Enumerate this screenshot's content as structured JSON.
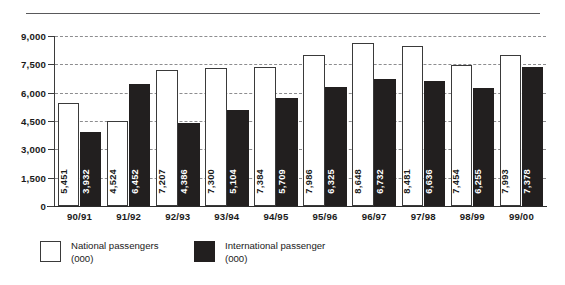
{
  "chart_data": {
    "type": "bar",
    "title": "",
    "subtitle": "",
    "xlabel": "",
    "ylabel": "",
    "ylim": [
      0,
      9000
    ],
    "yticks": [
      "0",
      "1,500",
      "3,000",
      "4,500",
      "6,000",
      "7,500",
      "9,000"
    ],
    "ytick_values": [
      0,
      1500,
      3000,
      4500,
      6000,
      7500,
      9000
    ],
    "grid": "horizontal-dashed",
    "legend_position": "bottom-left",
    "categories": [
      "90/91",
      "91/92",
      "92/93",
      "93/94",
      "94/95",
      "95/96",
      "96/97",
      "97/98",
      "98/99",
      "99/00"
    ],
    "series": [
      {
        "name": "National passengers (000)",
        "color": "#ffffff",
        "edge_color": "#3a3a3a",
        "values": [
          5451,
          4524,
          7207,
          7300,
          7384,
          7986,
          8648,
          8481,
          7454,
          7993
        ],
        "labels": [
          "5,451",
          "4,524",
          "7,207",
          "7,300",
          "7,384",
          "7,986",
          "8,648",
          "8,481",
          "7,454",
          "7,993"
        ]
      },
      {
        "name": "International passenger (000)",
        "color": "#221f1f",
        "edge_color": "#221f1f",
        "values": [
          3932,
          6452,
          4386,
          5104,
          5709,
          6325,
          6732,
          6636,
          6255,
          7378
        ],
        "labels": [
          "3,932",
          "6,452",
          "4,386",
          "5,104",
          "5,709",
          "6,325",
          "6,732",
          "6,636",
          "6,255",
          "7,378"
        ]
      }
    ]
  },
  "legend": {
    "items": [
      {
        "line1": "National passengers",
        "line2": "(000)",
        "swatch": "white"
      },
      {
        "line1": "International passenger",
        "line2": "(000)",
        "swatch": "black"
      }
    ]
  }
}
